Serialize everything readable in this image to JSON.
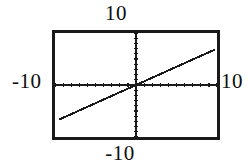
{
  "screen": {
    "width": 250,
    "height": 165,
    "background_color": "#ffffff",
    "foreground_color": "#1a1a1a"
  },
  "labels": {
    "y_max": "10",
    "y_min": "-10",
    "x_min": "-10",
    "x_max": "10"
  },
  "chart_data": {
    "type": "line",
    "title": "",
    "xlabel": "",
    "ylabel": "",
    "xlim": [
      -10,
      10
    ],
    "ylim": [
      -10,
      10
    ],
    "xtick_labels": [
      "-10",
      "10"
    ],
    "ytick_labels": [
      "-10",
      "10"
    ],
    "tick_interval": 1,
    "grid": false,
    "legend": "none",
    "axes_style": "centered-crosshair-with-unit-ticks",
    "frame": "rectangular-border",
    "series": [
      {
        "name": "y = 0.7x",
        "slope": 0.7,
        "intercept": 0,
        "color": "#1a1a1a",
        "x": [
          -9.5,
          -7,
          -5,
          -2.5,
          0,
          2.5,
          5,
          7,
          9.8
        ],
        "y": [
          -6.65,
          -4.9,
          -3.5,
          -1.75,
          0,
          1.75,
          3.5,
          4.9,
          6.86
        ]
      }
    ],
    "annotations": []
  }
}
